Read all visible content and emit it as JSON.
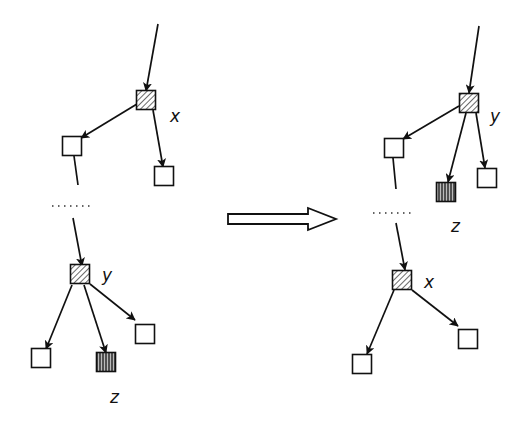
{
  "diagram": {
    "title": "",
    "transform_arrow": {
      "x1": 228,
      "x2": 336,
      "y": 219
    },
    "left_tree": {
      "nodes": [
        {
          "id": "x",
          "label": "x",
          "type": "hatched",
          "x": 146,
          "y": 100,
          "label_x": 170,
          "label_y": 122
        },
        {
          "id": "l1",
          "label": "",
          "type": "empty",
          "x": 72,
          "y": 146
        },
        {
          "id": "l2",
          "label": "",
          "type": "empty",
          "x": 164,
          "y": 176
        },
        {
          "id": "y",
          "label": "y",
          "type": "hatched",
          "x": 80,
          "y": 274,
          "label_x": 102,
          "label_y": 281
        },
        {
          "id": "l3",
          "label": "",
          "type": "empty",
          "x": 41,
          "y": 358
        },
        {
          "id": "z",
          "label": "z",
          "type": "striped",
          "x": 106,
          "y": 362,
          "label_x": 110,
          "label_y": 403
        },
        {
          "id": "l4",
          "label": "",
          "type": "empty",
          "x": 145,
          "y": 334
        }
      ],
      "edges": [
        {
          "x1": 158,
          "y1": 24,
          "x2": 146,
          "y2": 91
        },
        {
          "x1": 137,
          "y1": 104,
          "x2": 81,
          "y2": 138
        },
        {
          "x1": 153,
          "y1": 110,
          "x2": 163,
          "y2": 167
        },
        {
          "x1": 74,
          "y1": 156,
          "x2": 78,
          "y2": 185,
          "arrow": false
        },
        {
          "x1": 73,
          "y1": 218,
          "x2": 82,
          "y2": 266
        },
        {
          "x1": 72,
          "y1": 285,
          "x2": 46,
          "y2": 349
        },
        {
          "x1": 84,
          "y1": 285,
          "x2": 106,
          "y2": 353
        },
        {
          "x1": 90,
          "y1": 284,
          "x2": 135,
          "y2": 320
        }
      ],
      "ellipsis": {
        "x1": 52,
        "x2": 92,
        "y": 206
      }
    },
    "right_tree": {
      "nodes": [
        {
          "id": "y",
          "label": "y",
          "type": "hatched",
          "x": 469,
          "y": 103,
          "label_x": 490,
          "label_y": 122
        },
        {
          "id": "r1",
          "label": "",
          "type": "empty",
          "x": 394,
          "y": 148
        },
        {
          "id": "z",
          "label": "z",
          "type": "striped",
          "x": 446,
          "y": 192,
          "label_x": 451,
          "label_y": 232
        },
        {
          "id": "r2",
          "label": "",
          "type": "empty",
          "x": 487,
          "y": 178
        },
        {
          "id": "x",
          "label": "x",
          "type": "hatched",
          "x": 402,
          "y": 280,
          "label_x": 424,
          "label_y": 288
        },
        {
          "id": "r3",
          "label": "",
          "type": "empty",
          "x": 362,
          "y": 364
        },
        {
          "id": "r4",
          "label": "",
          "type": "empty",
          "x": 468,
          "y": 339
        }
      ],
      "edges": [
        {
          "x1": 479,
          "y1": 26,
          "x2": 469,
          "y2": 93
        },
        {
          "x1": 459,
          "y1": 106,
          "x2": 403,
          "y2": 139
        },
        {
          "x1": 466,
          "y1": 113,
          "x2": 448,
          "y2": 182
        },
        {
          "x1": 476,
          "y1": 113,
          "x2": 485,
          "y2": 168
        },
        {
          "x1": 393,
          "y1": 158,
          "x2": 396,
          "y2": 189,
          "arrow": false
        },
        {
          "x1": 396,
          "y1": 223,
          "x2": 405,
          "y2": 270
        },
        {
          "x1": 394,
          "y1": 290,
          "x2": 367,
          "y2": 354
        },
        {
          "x1": 412,
          "y1": 290,
          "x2": 458,
          "y2": 326
        }
      ],
      "ellipsis": {
        "x1": 373,
        "x2": 413,
        "y": 213
      }
    },
    "colors": {
      "stroke": "#111111",
      "hatch": "#555555",
      "background": "#ffffff"
    }
  }
}
